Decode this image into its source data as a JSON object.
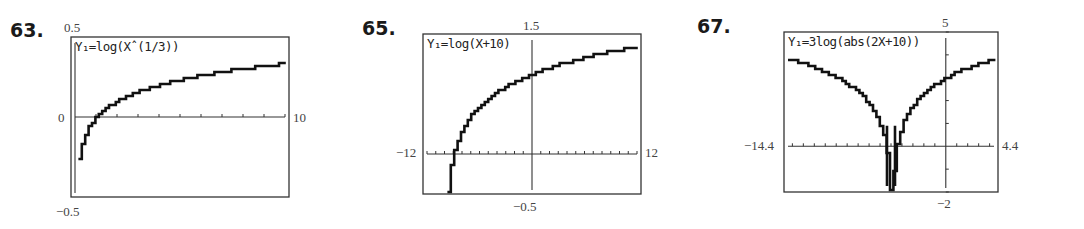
{
  "chart_data": [
    {
      "type": "line",
      "problem": "63.",
      "equation": "Y1=log(X^(1/3))",
      "equation_display": "Y₁=log(Xˆ(1/3))",
      "function": "log10(cbrt(x))",
      "xlim": [
        0,
        10
      ],
      "ylim": [
        -0.5,
        0.5
      ],
      "tick_labels": {
        "ymax": "0.5",
        "ymin": "−0.5",
        "xmin": "0",
        "xmax": "10"
      },
      "xscale": 1,
      "grid": false,
      "frame": {
        "x0": 71,
        "y0": 37,
        "x1": 289,
        "y1": 197
      },
      "x": [
        0.1,
        0.2,
        0.5,
        1,
        2,
        3,
        4,
        5,
        6,
        7,
        8,
        9,
        10
      ],
      "y": [
        -0.333,
        -0.233,
        -0.1,
        0,
        0.1,
        0.159,
        0.201,
        0.233,
        0.259,
        0.282,
        0.301,
        0.318,
        0.333
      ]
    },
    {
      "type": "line",
      "problem": "65.",
      "equation": "Y1=log(X+10)",
      "equation_display": "Y₁=log(X+10)",
      "function": "log10(x+10)",
      "xlim": [
        -12,
        12
      ],
      "ylim": [
        -0.5,
        1.5
      ],
      "tick_labels": {
        "ymax": "1.5",
        "ymin": "−0.5",
        "xmin": "−12",
        "xmax": "12"
      },
      "xscale": 1,
      "grid": false,
      "frame": {
        "x0": 423,
        "y0": 34,
        "x1": 641,
        "y1": 194
      },
      "x": [
        -9.7,
        -9,
        -8,
        -6,
        -4,
        -2,
        0,
        2,
        4,
        6,
        8,
        10,
        12
      ],
      "y": [
        -0.523,
        0,
        0.301,
        0.602,
        0.778,
        0.903,
        1,
        1.079,
        1.146,
        1.204,
        1.255,
        1.301,
        1.342
      ]
    },
    {
      "type": "line",
      "problem": "67.",
      "equation": "Y1=3log(abs(2X+10))",
      "equation_display": "Y₁=3log(abs(2X+10))",
      "function": "3*log10(abs(2x+10))",
      "xlim": [
        -14.4,
        4.4
      ],
      "ylim": [
        -2,
        5
      ],
      "tick_labels": {
        "ymax": "5",
        "ymin": "−2",
        "xmin": "−14.4",
        "xmax": "4.4"
      },
      "xscale": 1,
      "yscale": 1,
      "grid": false,
      "frame": {
        "x0": 784,
        "y0": 32,
        "x1": 998,
        "y1": 192
      },
      "x": [
        -14.4,
        -12,
        -10,
        -8,
        -6,
        -5.2,
        -5,
        -4.8,
        -4,
        -2,
        0,
        2,
        4.4
      ],
      "y": [
        3.82,
        3.44,
        3.0,
        2.33,
        0.9,
        -2,
        null,
        -2,
        0.9,
        2.33,
        3.0,
        3.44,
        3.82
      ]
    }
  ]
}
